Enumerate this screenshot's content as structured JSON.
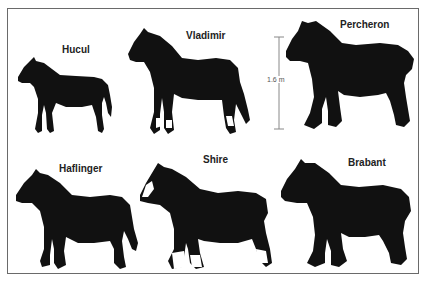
{
  "figure": {
    "scale_bar": {
      "label": "1.6 m",
      "color": "#888888"
    },
    "silhouette_color": "#111111",
    "breeds": [
      {
        "name": "Hucul",
        "row": 1,
        "col": 1,
        "type": "pony"
      },
      {
        "name": "Vladimir",
        "row": 1,
        "col": 2,
        "type": "draft-white-socks"
      },
      {
        "name": "Percheron",
        "row": 1,
        "col": 3,
        "type": "heavy-draft"
      },
      {
        "name": "Haflinger",
        "row": 2,
        "col": 1,
        "type": "pony"
      },
      {
        "name": "Shire",
        "row": 2,
        "col": 2,
        "type": "draft-white-feathers"
      },
      {
        "name": "Brabant",
        "row": 2,
        "col": 3,
        "type": "heavy-draft"
      }
    ]
  }
}
